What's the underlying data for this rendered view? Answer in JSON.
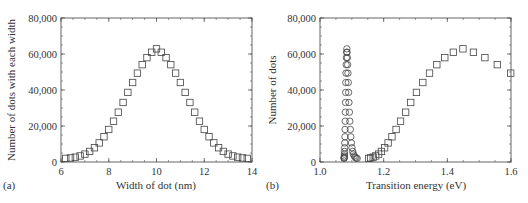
{
  "chart_data": [
    {
      "type": "scatter",
      "panel_label": "(a)",
      "title": "",
      "xlabel": "Width of dot (nm)",
      "ylabel": "Number of dots with each width",
      "xlim": [
        6,
        14
      ],
      "ylim": [
        0,
        80000
      ],
      "xticks": [
        6,
        8,
        10,
        12,
        14
      ],
      "xtick_labels": [
        "6",
        "8",
        "10",
        "12",
        "14"
      ],
      "yticks": [
        0,
        20000,
        40000,
        60000,
        80000
      ],
      "ytick_labels": [
        "0",
        "20,000",
        "40,000",
        "60,000",
        "80,000"
      ],
      "grid": false,
      "legend": null,
      "series": [
        {
          "name": "dot widths",
          "marker": "square",
          "x": [
            6.2,
            6.4,
            6.6,
            6.8,
            7.0,
            7.2,
            7.4,
            7.6,
            7.8,
            8.0,
            8.2,
            8.4,
            8.6,
            8.8,
            9.0,
            9.2,
            9.4,
            9.6,
            9.8,
            10.0,
            10.2,
            10.4,
            10.6,
            10.8,
            11.0,
            11.2,
            11.4,
            11.6,
            11.8,
            12.0,
            12.2,
            12.4,
            12.6,
            12.8,
            13.0,
            13.2,
            13.4,
            13.6,
            13.8
          ],
          "y": [
            340,
            600,
            1020,
            1700,
            2720,
            4200,
            6250,
            8950,
            12350,
            16400,
            21000,
            26000,
            31400,
            37000,
            42500,
            47700,
            52400,
            56300,
            59300,
            61200,
            59300,
            56300,
            52400,
            47700,
            42500,
            37000,
            31400,
            26000,
            21000,
            16400,
            12350,
            8950,
            6250,
            4200,
            2720,
            1700,
            1020,
            600,
            340
          ]
        }
      ]
    },
    {
      "type": "scatter",
      "panel_label": "(b)",
      "title": "",
      "xlabel": "Transition energy (eV)",
      "ylabel": "Number of dots",
      "xlim": [
        1.0,
        1.6
      ],
      "ylim": [
        0,
        80000
      ],
      "xticks": [
        1.0,
        1.2,
        1.4,
        1.6
      ],
      "xtick_labels": [
        "1.0",
        "1.2",
        "1.4",
        "1.6"
      ],
      "yticks": [
        0,
        20000,
        40000,
        60000,
        80000
      ],
      "ytick_labels": [
        "0",
        "20,000",
        "40,000",
        "60,000",
        "80,000"
      ],
      "grid": false,
      "legend": null,
      "series": [
        {
          "name": "circles",
          "marker": "circle",
          "x": [
            1.0755,
            1.0758,
            1.0762,
            1.0765,
            1.0768,
            1.0771,
            1.0775,
            1.0779,
            1.0783,
            1.0787,
            1.0791,
            1.0796,
            1.0801,
            1.0806,
            1.0811,
            1.0817,
            1.0823,
            1.0829,
            1.0836,
            1.0843,
            1.0851,
            1.0859,
            1.0868,
            1.0878,
            1.0888,
            1.0899,
            1.091,
            1.0923,
            1.0937,
            1.0952,
            1.0968,
            1.0986,
            1.1005,
            1.1026,
            1.1049,
            1.1075,
            1.1103,
            1.1134,
            1.1168
          ],
          "y": [
            340,
            600,
            1020,
            1700,
            2720,
            4200,
            6250,
            8950,
            12350,
            16400,
            21000,
            26000,
            31400,
            37000,
            42500,
            47700,
            52400,
            56300,
            59300,
            61200,
            59300,
            56300,
            52400,
            47700,
            42500,
            37000,
            31400,
            26000,
            21000,
            16400,
            12350,
            8950,
            6250,
            4200,
            2720,
            1700,
            1020,
            600,
            340
          ]
        },
        {
          "name": "squares",
          "marker": "square",
          "x": [
            1.153,
            1.159,
            1.167,
            1.175,
            1.184,
            1.193,
            1.203,
            1.214,
            1.226,
            1.239,
            1.253,
            1.269,
            1.285,
            1.303,
            1.323,
            1.344,
            1.367,
            1.392,
            1.419,
            1.449,
            1.482,
            1.518,
            1.557,
            1.599
          ],
          "y": [
            340,
            600,
            1020,
            1700,
            2720,
            4200,
            6250,
            8950,
            12350,
            16400,
            21000,
            26000,
            31400,
            37000,
            42500,
            47700,
            52400,
            56300,
            59300,
            61200,
            59300,
            56300,
            52400,
            47700
          ]
        }
      ]
    }
  ]
}
